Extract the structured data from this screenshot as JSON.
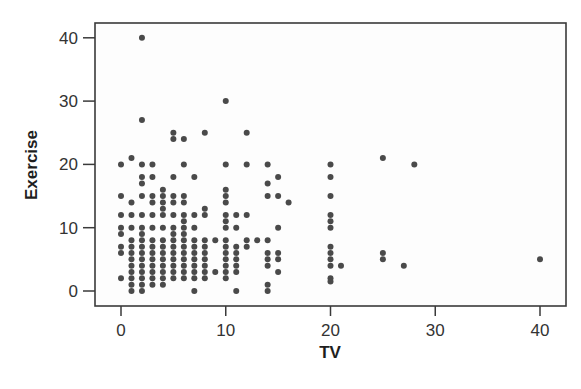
{
  "chart_data": {
    "type": "scatter",
    "title": "",
    "xlabel": "TV",
    "ylabel": "Exercise",
    "xlim": [
      -2.5,
      42.5
    ],
    "ylim": [
      -2.4,
      42.4
    ],
    "xticks": [
      0,
      10,
      20,
      30,
      40
    ],
    "yticks": [
      0,
      10,
      20,
      30,
      40
    ],
    "grid": false,
    "legend": null,
    "marker_color": "#4a4a4a",
    "series": [
      {
        "name": "Students",
        "points": [
          [
            0,
            20
          ],
          [
            0,
            15
          ],
          [
            0,
            12
          ],
          [
            0,
            10
          ],
          [
            0,
            9
          ],
          [
            0,
            7
          ],
          [
            0,
            6
          ],
          [
            0,
            2
          ],
          [
            1,
            21
          ],
          [
            1,
            14
          ],
          [
            1,
            12
          ],
          [
            1,
            10
          ],
          [
            1,
            8
          ],
          [
            1,
            7
          ],
          [
            1,
            6
          ],
          [
            1,
            5
          ],
          [
            1,
            4
          ],
          [
            1,
            3
          ],
          [
            1,
            2
          ],
          [
            1,
            1
          ],
          [
            1,
            0
          ],
          [
            2,
            40
          ],
          [
            2,
            27
          ],
          [
            2,
            20
          ],
          [
            2,
            18
          ],
          [
            2,
            17
          ],
          [
            2,
            15
          ],
          [
            2,
            12
          ],
          [
            2,
            10
          ],
          [
            2,
            9
          ],
          [
            2,
            8
          ],
          [
            2,
            7
          ],
          [
            2,
            6
          ],
          [
            2,
            5
          ],
          [
            2,
            4
          ],
          [
            2,
            3
          ],
          [
            2,
            2
          ],
          [
            2,
            1
          ],
          [
            2,
            0
          ],
          [
            3,
            20
          ],
          [
            3,
            18
          ],
          [
            3,
            15
          ],
          [
            3,
            14
          ],
          [
            3,
            12
          ],
          [
            3,
            10
          ],
          [
            3,
            8
          ],
          [
            3,
            7
          ],
          [
            3,
            6
          ],
          [
            3,
            5
          ],
          [
            3,
            4
          ],
          [
            3,
            3
          ],
          [
            3,
            2
          ],
          [
            3,
            1
          ],
          [
            4,
            16
          ],
          [
            4,
            15
          ],
          [
            4,
            14
          ],
          [
            4,
            13
          ],
          [
            4,
            12
          ],
          [
            4,
            10
          ],
          [
            4,
            8
          ],
          [
            4,
            7
          ],
          [
            4,
            6
          ],
          [
            4,
            5
          ],
          [
            4,
            4
          ],
          [
            4,
            3
          ],
          [
            4,
            2
          ],
          [
            4,
            1
          ],
          [
            5,
            25
          ],
          [
            5,
            24
          ],
          [
            5,
            18
          ],
          [
            5,
            15
          ],
          [
            5,
            14
          ],
          [
            5,
            12
          ],
          [
            5,
            10
          ],
          [
            5,
            9
          ],
          [
            5,
            8
          ],
          [
            5,
            7
          ],
          [
            5,
            6
          ],
          [
            5,
            5
          ],
          [
            5,
            4
          ],
          [
            5,
            3
          ],
          [
            5,
            2
          ],
          [
            6,
            24
          ],
          [
            6,
            20
          ],
          [
            6,
            15
          ],
          [
            6,
            14
          ],
          [
            6,
            12
          ],
          [
            6,
            11
          ],
          [
            6,
            10
          ],
          [
            6,
            9
          ],
          [
            6,
            8
          ],
          [
            6,
            7
          ],
          [
            6,
            6
          ],
          [
            6,
            5
          ],
          [
            6,
            4
          ],
          [
            6,
            3
          ],
          [
            6,
            2
          ],
          [
            7,
            18
          ],
          [
            7,
            12
          ],
          [
            7,
            10
          ],
          [
            7,
            8
          ],
          [
            7,
            7
          ],
          [
            7,
            6
          ],
          [
            7,
            5
          ],
          [
            7,
            4
          ],
          [
            7,
            3
          ],
          [
            7,
            2
          ],
          [
            7,
            0
          ],
          [
            8,
            25
          ],
          [
            8,
            13
          ],
          [
            8,
            12
          ],
          [
            8,
            8
          ],
          [
            8,
            7
          ],
          [
            8,
            6
          ],
          [
            8,
            5
          ],
          [
            8,
            4
          ],
          [
            8,
            3
          ],
          [
            8,
            2
          ],
          [
            9,
            8
          ],
          [
            9,
            3
          ],
          [
            10,
            30
          ],
          [
            10,
            20
          ],
          [
            10,
            16
          ],
          [
            10,
            15
          ],
          [
            10,
            14
          ],
          [
            10,
            12
          ],
          [
            10,
            11
          ],
          [
            10,
            10
          ],
          [
            10,
            8
          ],
          [
            10,
            7
          ],
          [
            10,
            6
          ],
          [
            10,
            5
          ],
          [
            10,
            4
          ],
          [
            10,
            3
          ],
          [
            10,
            2
          ],
          [
            11,
            10
          ],
          [
            11,
            12
          ],
          [
            11,
            7
          ],
          [
            11,
            6
          ],
          [
            11,
            5
          ],
          [
            11,
            4
          ],
          [
            11,
            3
          ],
          [
            11,
            0
          ],
          [
            12,
            25
          ],
          [
            12,
            20
          ],
          [
            12,
            12
          ],
          [
            12,
            8
          ],
          [
            12,
            7
          ],
          [
            13,
            8
          ],
          [
            14,
            20
          ],
          [
            14,
            17
          ],
          [
            14,
            15
          ],
          [
            14,
            8
          ],
          [
            14,
            6
          ],
          [
            14,
            5
          ],
          [
            14,
            4
          ],
          [
            14,
            1
          ],
          [
            14,
            0
          ],
          [
            15,
            18
          ],
          [
            15,
            15
          ],
          [
            15,
            10
          ],
          [
            15,
            6
          ],
          [
            15,
            5
          ],
          [
            15,
            3
          ],
          [
            16,
            14
          ],
          [
            20,
            20
          ],
          [
            20,
            18
          ],
          [
            20,
            15
          ],
          [
            20,
            12
          ],
          [
            20,
            11
          ],
          [
            20,
            10
          ],
          [
            20,
            7
          ],
          [
            20,
            6
          ],
          [
            20,
            5
          ],
          [
            20,
            4
          ],
          [
            20,
            2
          ],
          [
            20,
            1.5
          ],
          [
            21,
            4
          ],
          [
            25,
            21
          ],
          [
            25,
            6
          ],
          [
            25,
            5
          ],
          [
            27,
            4
          ],
          [
            28,
            20
          ],
          [
            40,
            5
          ]
        ]
      }
    ]
  }
}
